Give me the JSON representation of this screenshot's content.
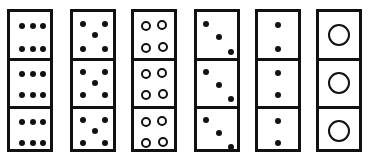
{
  "figure": {
    "colors": {
      "ink": "#111111",
      "background": "#ffffff"
    },
    "strips": [
      {
        "index": 1,
        "left": 7,
        "cells": [
          {
            "pattern": "six-dots-2x3",
            "filled": true
          },
          {
            "pattern": "six-dots-2x3",
            "filled": true
          },
          {
            "pattern": "six-dots-2x3",
            "filled": true
          }
        ]
      },
      {
        "index": 2,
        "left": 70,
        "cells": [
          {
            "pattern": "five-dots-quincunx",
            "filled": true
          },
          {
            "pattern": "five-dots-quincunx",
            "filled": true
          },
          {
            "pattern": "five-dots-quincunx",
            "filled": true
          }
        ]
      },
      {
        "index": 3,
        "left": 131,
        "cells": [
          {
            "pattern": "four-rings-2x2",
            "filled": false
          },
          {
            "pattern": "four-rings-2x2",
            "filled": false
          },
          {
            "pattern": "four-rings-2x2",
            "filled": false
          }
        ]
      },
      {
        "index": 4,
        "left": 194,
        "cells": [
          {
            "pattern": "three-dots-diagonal",
            "filled": true
          },
          {
            "pattern": "three-dots-diagonal",
            "filled": true
          },
          {
            "pattern": "three-dots-diagonal",
            "filled": true
          }
        ]
      },
      {
        "index": 5,
        "left": 255,
        "cells": [
          {
            "pattern": "two-dots-vertical",
            "filled": true
          },
          {
            "pattern": "two-dots-vertical",
            "filled": true
          },
          {
            "pattern": "two-dots-vertical",
            "filled": true
          }
        ]
      },
      {
        "index": 6,
        "left": 316,
        "cells": [
          {
            "pattern": "one-large-ring",
            "filled": false
          },
          {
            "pattern": "one-large-ring",
            "filled": false
          },
          {
            "pattern": "one-large-ring",
            "filled": false
          }
        ]
      }
    ]
  }
}
